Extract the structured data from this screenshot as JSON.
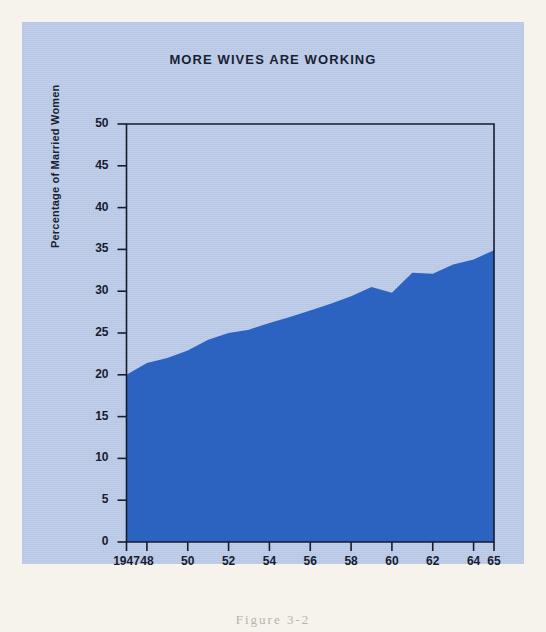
{
  "figure": {
    "caption": "Figure 3-2",
    "panel_color": "#b6c6e4",
    "paper_color": "#f6f3ec",
    "ink_color": "#171c2e"
  },
  "chart_data": {
    "type": "area",
    "title": "MORE WIVES ARE WORKING",
    "xlabel": "",
    "ylabel": "Percentage of Married Women",
    "xlim": [
      1947,
      1965
    ],
    "ylim": [
      0,
      50
    ],
    "grid": false,
    "legend": "none",
    "series_color": "#2c63c0",
    "x": [
      1947,
      1948,
      1949,
      1950,
      1951,
      1952,
      1953,
      1954,
      1955,
      1956,
      1957,
      1958,
      1959,
      1960,
      1961,
      1962,
      1963,
      1964,
      1965
    ],
    "series": [
      {
        "name": "Percentage of Married Women Working",
        "values": [
          20.0,
          21.4,
          22.0,
          22.9,
          24.2,
          25.0,
          25.4,
          26.2,
          26.9,
          27.7,
          28.5,
          29.4,
          30.5,
          29.8,
          32.2,
          32.1,
          33.2,
          33.8,
          34.9
        ]
      }
    ],
    "y_ticks": [
      0,
      5,
      10,
      15,
      20,
      25,
      30,
      35,
      40,
      45,
      50
    ],
    "y_tick_labels": [
      "0",
      "5",
      "10",
      "15",
      "20",
      "25",
      "30",
      "35",
      "40",
      "45",
      "50"
    ],
    "x_ticks": [
      1947,
      1948,
      1950,
      1952,
      1954,
      1956,
      1958,
      1960,
      1962,
      1964,
      1965
    ],
    "x_tick_labels": [
      "1947",
      "48",
      "50",
      "52",
      "54",
      "56",
      "58",
      "60",
      "62",
      "64",
      "65"
    ]
  }
}
